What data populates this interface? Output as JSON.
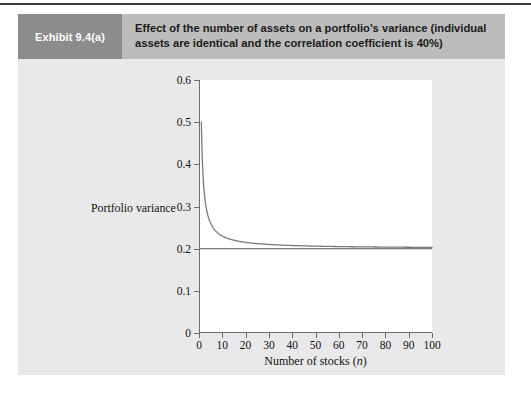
{
  "exhibit": {
    "tag": "Exhibit 9.4(a)",
    "caption": "Effect of the number of assets on a portfolio's variance (individual assets are identical and the correlation coefficient is 40%)"
  },
  "colors": {
    "tag_band": "#8c8c8c",
    "caption_band": "#bcbcbc",
    "panel": "#e9e9eb",
    "plot_background": "#ffffff",
    "curve": "#7a7a7a",
    "asymptote": "#7a7a7a",
    "axis": "#6d6d6d",
    "page": "#ffffff",
    "top_rule": "#3a3a3a"
  },
  "chart_data": {
    "type": "line",
    "title": "Effect of the number of assets on a portfolio's variance (individual assets are identical and the correlation coefficient is 40%)",
    "xlabel": "Number of stocks (n)",
    "ylabel": "Portfolio variance",
    "xlim": [
      0,
      100
    ],
    "ylim": [
      0,
      0.6
    ],
    "grid": false,
    "legend": "none",
    "xticks": [
      0,
      10,
      20,
      30,
      40,
      50,
      60,
      70,
      80,
      90,
      100
    ],
    "xticklabels": [
      "0",
      "10",
      "20",
      "30",
      "40",
      "50",
      "60",
      "70",
      "80",
      "90",
      "100"
    ],
    "yticks": [
      0,
      0.1,
      0.2,
      0.3,
      0.4,
      0.5,
      0.6
    ],
    "yticklabels": [
      "0",
      "0.1",
      "0.2",
      "0.3",
      "0.4",
      "0.5",
      "0.6"
    ],
    "series": [
      {
        "name": "Portfolio variance",
        "note": "variance = 0.2 + 0.3/n  (individual variance 0.5, correlation 40%)",
        "x": [
          1,
          2,
          3,
          4,
          5,
          6,
          7,
          8,
          9,
          10,
          12,
          14,
          16,
          18,
          20,
          25,
          30,
          35,
          40,
          50,
          60,
          70,
          80,
          90,
          100
        ],
        "values": [
          0.5,
          0.35,
          0.3,
          0.275,
          0.26,
          0.25,
          0.2429,
          0.2375,
          0.2333,
          0.23,
          0.225,
          0.2214,
          0.21875,
          0.2167,
          0.215,
          0.212,
          0.21,
          0.2086,
          0.2075,
          0.206,
          0.205,
          0.2043,
          0.2038,
          0.2033,
          0.203
        ]
      },
      {
        "name": "Systematic variance asymptote",
        "note": "horizontal line at 0.2",
        "x": [
          0,
          100
        ],
        "values": [
          0.2,
          0.2
        ]
      }
    ],
    "annotations": []
  }
}
